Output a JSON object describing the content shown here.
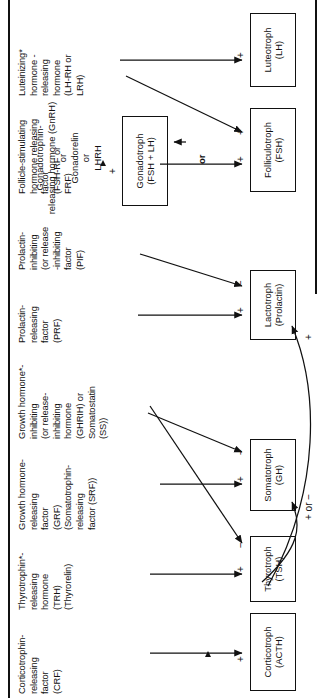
{
  "diagram": {
    "type": "flow-diagram",
    "title_present": false,
    "orientation": "rotated-90-ccw",
    "columns": [
      {
        "id": "crf",
        "label": "Corticotrophin-\nreleasing\nfactor\n(CRF)",
        "asterisk": false
      },
      {
        "id": "trh",
        "label": "Thyrotrophin*-\nreleasing\nhormone\n(TRH)\n(Thyrorelin)",
        "asterisk": true
      },
      {
        "id": "grf",
        "label": "Growth hormone-\nreleasing\nfactor\n(GRF)\n(Somatotrophin-\nreleasing\nfactor (SRF))",
        "asterisk": false
      },
      {
        "id": "ghrih",
        "label": "Growth hormone*-\ninhibiting\n(or release-\ninhibiting\nhormone\n(GHRIH) or\nSomatostatin\n(SS))",
        "asterisk": true
      },
      {
        "id": "prf",
        "label": "Prolactin-\nreleasing\nfactor\n(PRF)",
        "asterisk": false
      },
      {
        "id": "pif",
        "label": "Prolactin-\ninhibiting\n(or release\n-inhibiting\nfactor\n(PIF)",
        "asterisk": false
      },
      {
        "id": "fshrf",
        "label": "Follicle-stimulating\nhormone releasing\nfactor\n(FSH-RF or\nFRF)",
        "asterisk": false
      },
      {
        "id": "lhrh",
        "label": "Luteinizing*\nhormone -\nreleasing\nhormone\n(LH-RH or\nLRH)",
        "asterisk": true
      }
    ],
    "targets": [
      {
        "id": "corticotroph",
        "label": "Corticotroph\n(ACTH)"
      },
      {
        "id": "thyrotroph",
        "label": "Thyrotroph\n(TSH)"
      },
      {
        "id": "somatotroph",
        "label": "Somatotroph\n(GH)"
      },
      {
        "id": "lactotroph",
        "label": "Lactotroph\n(Prolactin)"
      },
      {
        "id": "folliculotroph",
        "label": "Folliculotroph\n(FSH)"
      },
      {
        "id": "luteotroph",
        "label": "Luteotroph\n(LH)"
      },
      {
        "id": "gonadotroph",
        "label": "Gonadotroph\n(FSH + LH)"
      }
    ],
    "alternative": {
      "or_label": "or",
      "gonadotroph_sign": "+",
      "name": "Gonadotrophin-\nreleasing hormone (GnRH)\nor\nGonadorelin\nor\nLHRH"
    },
    "edges": [
      {
        "from": "crf",
        "to": "corticotroph",
        "sign": "+"
      },
      {
        "from": "trh",
        "to": "thyrotroph",
        "sign": "+"
      },
      {
        "from": "ghrih",
        "to": "thyrotroph",
        "sign": "−"
      },
      {
        "from": "grf",
        "to": "somatotroph",
        "sign": "+"
      },
      {
        "from": "ghrih",
        "to": "somatotroph",
        "sign": "−"
      },
      {
        "from": "trh",
        "to": "somatotroph",
        "sign": "+ or −"
      },
      {
        "from": "prf",
        "to": "lactotroph",
        "sign": "+"
      },
      {
        "from": "pif",
        "to": "lactotroph",
        "sign": "−"
      },
      {
        "from": "trh",
        "to": "lactotroph",
        "sign": "+"
      },
      {
        "from": "fshrf",
        "to": "folliculotroph",
        "sign": "+"
      },
      {
        "from": "lhrh",
        "to": "folliculotroph",
        "sign": "+"
      },
      {
        "from": "lhrh",
        "to": "luteotroph",
        "sign": "+"
      }
    ],
    "signs": {
      "plus": "+",
      "minus": "−",
      "plus_or_minus": "+ or −"
    },
    "colors": {
      "ink": "#111111",
      "paper": "#ffffff"
    }
  }
}
